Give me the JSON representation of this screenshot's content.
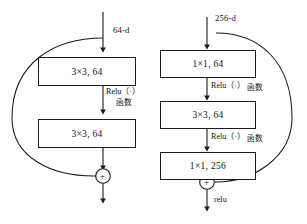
{
  "figure": {
    "background_color": "#ffffff",
    "line_color": "#1a1a1a",
    "text_color": "#111111"
  },
  "left_block": {
    "name": "basic-residual-block",
    "input_label": "64-d",
    "layers": [
      {
        "label": "3×3, 64"
      },
      {
        "label": "3×3, 64"
      }
    ],
    "activations": [
      {
        "main": "Relu（·）",
        "cjk": "函数"
      }
    ],
    "sum_symbol": "+",
    "output_label": ""
  },
  "right_block": {
    "name": "bottleneck-residual-block",
    "input_label": "256-d",
    "layers": [
      {
        "label": "1×1, 64"
      },
      {
        "label": "3×3, 64"
      },
      {
        "label": "1×1, 256"
      }
    ],
    "activations": [
      {
        "main": "Relu（·）",
        "cjk": "函数"
      },
      {
        "main": "Relu（·）",
        "cjk": "函数"
      }
    ],
    "sum_symbol": "+",
    "output_label": "relu"
  }
}
